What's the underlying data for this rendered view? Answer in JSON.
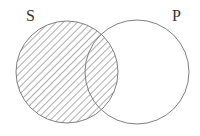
{
  "diagram": {
    "type": "venn",
    "sets": [
      {
        "label": "S",
        "shaded": true,
        "cx": 67,
        "cy": 72,
        "r": 51
      },
      {
        "label": "P",
        "shaded": false,
        "cx": 137,
        "cy": 72,
        "r": 52
      }
    ],
    "shading": "diagonal-hatch",
    "stroke_color": "#808080",
    "hatch_color": "#6a6a6a"
  }
}
